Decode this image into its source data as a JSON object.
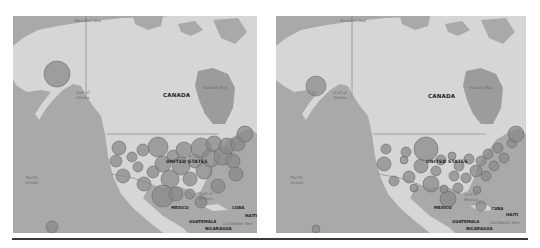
{
  "figure": {
    "panels": [
      {
        "id": "left",
        "labels": {
          "country_canada": "CANADA",
          "country_us": "UNITED STATES",
          "country_mexico": "MEXICO",
          "guatemala": "GUATEMALA",
          "nicaragua": "NICARAGUA",
          "cuba": "CUBA",
          "haiti": "HAITI",
          "beaufort": "Beaufort Sea",
          "hudson": "Hudson Bay",
          "gulf_alaska": "Gulf of Alaska",
          "gulf_mexico": "Gulf of Mexico",
          "pacific": "Pacific Ocean",
          "caribbean": "Caribbean Sea"
        },
        "bubble_fill": "#8a8a8a",
        "bubble_stroke": "#6a6a6a"
      },
      {
        "id": "right",
        "labels": {
          "country_canada": "CANADA",
          "country_us": "UNITED STATES",
          "country_mexico": "MEXICO",
          "guatemala": "GUATEMALA",
          "nicaragua": "NICARAGUA",
          "cuba": "CUBA",
          "haiti": "HAITI",
          "beaufort": "Beaufort Sea",
          "hudson": "Hudson Bay",
          "gulf_alaska": "Gulf of Alaska",
          "gulf_mexico": "Gulf of Mexico",
          "pacific": "Pacific Ocean",
          "caribbean": "Caribbean Sea"
        },
        "bubble_fill": "#8a8a8a",
        "bubble_stroke": "#6a6a6a"
      }
    ],
    "colors": {
      "water": "#a9a9a9",
      "land": "#d6d6d6",
      "border": "#7a7a7a",
      "divider": "#3a3a3a"
    }
  }
}
